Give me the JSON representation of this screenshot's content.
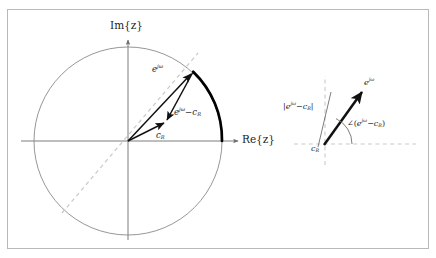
{
  "figure": {
    "title_present": false,
    "frame": {
      "border_color": "#b9b9b9",
      "background": "#ffffff"
    },
    "panels": [
      "unit-circle-panel",
      "detail-panel"
    ]
  },
  "colors": {
    "axis": "#6e6e6e",
    "circle": "#8a8a8a",
    "dashed": "#c9c9c9",
    "vector": "#111111",
    "arc_highlight": "#000000",
    "text": "#1c1c1c",
    "frame": "#b9b9b9",
    "background": "#ffffff"
  },
  "left_panel": {
    "name": "unit-circle-panel",
    "axes": {
      "imaginary_axis_label": "Im{z}",
      "real_axis_label": "Re{z}",
      "im_label_plain": "Im",
      "re_label_plain": "Re",
      "brace_open": "{",
      "variable": "z",
      "brace_close": "}"
    },
    "unit_circle": {
      "center": [
        128,
        141
      ],
      "radius": 94,
      "style": "solid-thin"
    },
    "dashed_diagonal": {
      "angle_deg": 69,
      "style": "dashed",
      "through_origin": true
    },
    "vectors": [
      {
        "name": "e-jw-vector",
        "label_html": "e<sup>j&omega;</sup>",
        "label_text": "e^{jω}",
        "from": [
          128,
          141
        ],
        "to": [
          193,
          72
        ]
      },
      {
        "name": "cR-vector",
        "label_html": "c<sub>R</sub>",
        "label_text": "c_R",
        "from": [
          128,
          141
        ],
        "to": [
          166,
          122
        ]
      },
      {
        "name": "difference-vector",
        "label_html": "e<sup>j&omega;</sup>&minus;c<sub>R</sub>",
        "label_text": "e^{jω} − c_R",
        "from": [
          193,
          72
        ],
        "to": [
          166,
          122
        ]
      }
    ],
    "highlighted_arc": {
      "name": "highlighted-arc",
      "from_point": [
        193,
        72
      ],
      "to_point": [
        222,
        141
      ],
      "style": "thick"
    }
  },
  "right_panel": {
    "name": "detail-panel",
    "labels": {
      "magnitude_html": "|e<sup>j&omega;</sup>&minus;c<sub>R</sub>|",
      "magnitude_text": "|e^{jω} − c_R|",
      "angle_html": "&ang;(e<sup>j&omega;</sup>&minus;c<sub>R</sub>)",
      "angle_text": "∠(e^{jω} − c_R)",
      "vector_html": "e<sup>j&omega;</sup>",
      "vector_text": "e^{jω}",
      "origin_html": "c<sub>R</sub>",
      "origin_text": "c_R"
    },
    "guides": {
      "horizontal_dashed": true,
      "vertical_dashed": true,
      "angle_arc": true
    },
    "vector": {
      "from": [
        324,
        144
      ],
      "to": [
        364,
        90
      ]
    }
  }
}
